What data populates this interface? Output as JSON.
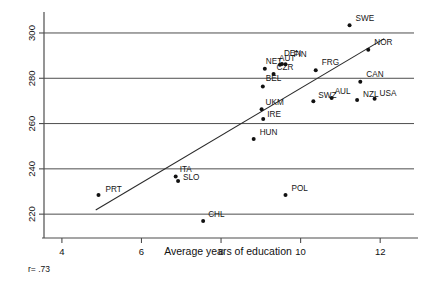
{
  "chart_data": {
    "type": "scatter",
    "title": "",
    "xlabel": "Average years of education",
    "ylabel": "",
    "xlim": [
      3.55,
      12.85
    ],
    "ylim": [
      213.0,
      307.5
    ],
    "xticks": [
      4,
      6,
      8,
      10,
      12
    ],
    "xtick_labels": [
      "4",
      "6",
      "8",
      "10",
      "12"
    ],
    "yticks": [
      220,
      240,
      260,
      280,
      300
    ],
    "ytick_labels": [
      "220",
      "240",
      "260",
      "280",
      "300"
    ],
    "grid": "horizontal",
    "legend": "none",
    "annotations": [
      {
        "name": "correlation",
        "text": "r= .73"
      }
    ],
    "trendline": {
      "name": "regression-line",
      "x_start": 4.85,
      "y_start": 221.8,
      "x_end": 12.1,
      "y_end": 297.5
    },
    "point_label_position": "upper-right",
    "points": [
      {
        "label": "PRT",
        "x": 4.92,
        "y": 228.5,
        "label_dx": 7,
        "label_dy": -3
      },
      {
        "label": "ITA",
        "x": 6.86,
        "y": 236.6,
        "label_dx": 4,
        "label_dy": -5
      },
      {
        "label": "SLO",
        "x": 6.92,
        "y": 234.6,
        "label_dx": 5,
        "label_dy": -1
      },
      {
        "label": "CHL",
        "x": 7.55,
        "y": 217.0,
        "label_dx": 5,
        "label_dy": -4
      },
      {
        "label": "HUN",
        "x": 8.82,
        "y": 253.2,
        "label_dx": 6,
        "label_dy": -4
      },
      {
        "label": "IRE",
        "x": 9.06,
        "y": 262.0,
        "label_dx": 4,
        "label_dy": -2
      },
      {
        "label": "UKM",
        "x": 9.02,
        "y": 266.3,
        "label_dx": 4,
        "label_dy": -4
      },
      {
        "label": "BEL",
        "x": 9.05,
        "y": 276.4,
        "label_dx": 3,
        "label_dy": -5
      },
      {
        "label": "NET",
        "x": 9.1,
        "y": 284.2,
        "label_dx": 1,
        "label_dy": -5
      },
      {
        "label": "CZR",
        "x": 9.32,
        "y": 281.9,
        "label_dx": 3,
        "label_dy": -4
      },
      {
        "label": "AUT",
        "x": 9.48,
        "y": 286.0,
        "label_dx": -1,
        "label_dy": -4
      },
      {
        "label": "DEN",
        "x": 9.53,
        "y": 286.3,
        "label_dx": 2,
        "label_dy": -8
      },
      {
        "label": "FIN",
        "x": 9.62,
        "y": 286.2,
        "label_dx": 8,
        "label_dy": -7
      },
      {
        "label": "POL",
        "x": 9.62,
        "y": 228.5,
        "label_dx": 6,
        "label_dy": -4
      },
      {
        "label": "SWZ",
        "x": 10.32,
        "y": 269.9,
        "label_dx": 5,
        "label_dy": -3
      },
      {
        "label": "FRG",
        "x": 10.38,
        "y": 283.5,
        "label_dx": 6,
        "label_dy": -5
      },
      {
        "label": "AUL",
        "x": 10.78,
        "y": 271.3,
        "label_dx": 3,
        "label_dy": -4
      },
      {
        "label": "NZL",
        "x": 11.42,
        "y": 270.4,
        "label_dx": 6,
        "label_dy": -3
      },
      {
        "label": "SWE",
        "x": 11.23,
        "y": 303.4,
        "label_dx": 6,
        "label_dy": -4
      },
      {
        "label": "CAN",
        "x": 11.5,
        "y": 278.5,
        "label_dx": 6,
        "label_dy": -5
      },
      {
        "label": "NOR",
        "x": 11.7,
        "y": 292.6,
        "label_dx": 6,
        "label_dy": -5
      },
      {
        "label": "USA",
        "x": 11.86,
        "y": 271.0,
        "label_dx": 5,
        "label_dy": -3
      }
    ]
  }
}
